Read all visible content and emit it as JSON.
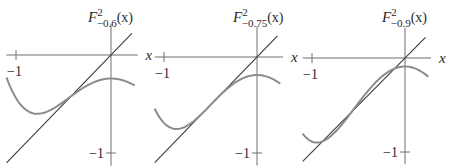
{
  "chart_data": [
    {
      "type": "line",
      "title": "F^2_{-0.6}(x)",
      "title_main": "F",
      "title_sup": "2",
      "title_sub": "−0.6",
      "title_arg": "(x)",
      "c": -0.6,
      "xlabel": "x",
      "ylabel": "F^2_{-0.6}(x)",
      "x_tick_label": "−1",
      "y_tick_label": "−1",
      "xlim": [
        -1.1,
        0.25
      ],
      "ylim": [
        -1.1,
        0.2
      ],
      "grid": false,
      "series": [
        {
          "name": "F^2_c(x) = (x^2 + c)^2 + c",
          "x": [
            -1.1,
            -1.0,
            -0.9,
            -0.8,
            -0.7,
            -0.6,
            -0.5,
            -0.4,
            -0.3,
            -0.2,
            -0.1,
            0.0,
            0.1,
            0.2,
            0.25
          ],
          "y": [
            -0.228,
            -0.44,
            -0.56,
            -0.6,
            -0.588,
            -0.542,
            -0.478,
            -0.411,
            -0.337,
            -0.284,
            -0.252,
            -0.24,
            -0.252,
            -0.284,
            -0.308
          ]
        },
        {
          "name": "y = x",
          "x": [
            -1.1,
            0.22
          ],
          "y": [
            -1.1,
            0.22
          ]
        }
      ],
      "panel": {
        "ox": 111,
        "oy": 55,
        "sx": 95,
        "sy": 98,
        "label_x": 88,
        "label_y": 22
      }
    },
    {
      "type": "line",
      "title": "F^2_{-0.75}(x)",
      "title_main": "F",
      "title_sup": "2",
      "title_sub": "−0.75",
      "title_arg": "(x)",
      "c": -0.75,
      "xlabel": "x",
      "ylabel": "F^2_{-0.75}(x)",
      "x_tick_label": "−1",
      "y_tick_label": "−1",
      "xlim": [
        -1.1,
        0.25
      ],
      "ylim": [
        -1.1,
        0.2
      ],
      "grid": false,
      "series": [
        {
          "name": "F^2_c(x) = (x^2 + c)^2 + c",
          "x": [
            -1.1,
            -1.0,
            -0.9,
            -0.8,
            -0.7,
            -0.6,
            -0.5,
            -0.4,
            -0.3,
            -0.2,
            -0.1,
            0.0,
            0.1,
            0.2,
            0.25
          ],
          "y": [
            -0.546,
            -0.688,
            -0.748,
            -0.735,
            -0.682,
            -0.604,
            -0.5,
            -0.403,
            -0.317,
            -0.25,
            -0.205,
            -0.188,
            -0.205,
            -0.25,
            -0.285
          ]
        },
        {
          "name": "y = x",
          "x": [
            -1.1,
            0.22
          ],
          "y": [
            -1.1,
            0.22
          ]
        }
      ],
      "panel": {
        "ox": 257,
        "oy": 57,
        "sx": 93,
        "sy": 96,
        "label_x": 233,
        "label_y": 22
      }
    },
    {
      "type": "line",
      "title": "F^2_{-0.9}(x)",
      "title_main": "F",
      "title_sup": "2",
      "title_sub": "−0.9",
      "title_arg": "(x)",
      "c": -0.9,
      "xlabel": "x",
      "ylabel": "F^2_{-0.9}(x)",
      "x_tick_label": "−1",
      "y_tick_label": "−1",
      "xlim": [
        -1.1,
        0.25
      ],
      "ylim": [
        -1.1,
        0.2
      ],
      "grid": false,
      "series": [
        {
          "name": "F^2_c(x) = (x^2 + c)^2 + c",
          "x": [
            -1.1,
            -1.0,
            -0.9,
            -0.8,
            -0.7,
            -0.6,
            -0.5,
            -0.4,
            -0.3,
            -0.2,
            -0.1,
            0.0,
            0.1,
            0.2,
            0.25
          ],
          "y": [
            -0.804,
            -0.89,
            -0.886,
            -0.833,
            -0.728,
            -0.606,
            -0.478,
            -0.354,
            -0.233,
            -0.158,
            -0.12,
            -0.09,
            -0.12,
            -0.158,
            -0.198
          ]
        },
        {
          "name": "y = x",
          "x": [
            -1.1,
            0.22
          ],
          "y": [
            -1.1,
            0.22
          ]
        }
      ],
      "panel": {
        "ox": 405,
        "oy": 58,
        "sx": 93,
        "sy": 94,
        "label_x": 382,
        "label_y": 22
      }
    }
  ]
}
